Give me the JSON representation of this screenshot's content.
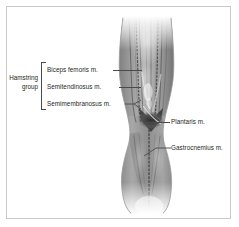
{
  "figure": {
    "background_color": "#ffffff",
    "frame_color": "#c9c9c9",
    "ink_color": "#231f20",
    "leader_color": "#4a4a4a"
  },
  "group": {
    "name_line1": "Hamstring",
    "name_line2": "group"
  },
  "labels": {
    "biceps_femoris": "Biceps femoris m.",
    "semitendinosus": "Semitendinosus m.",
    "semimembranosus": "Semimembranosus m.",
    "plantaris": "Plantaris m.",
    "gastrocnemius": "Gastrocnemius m."
  }
}
